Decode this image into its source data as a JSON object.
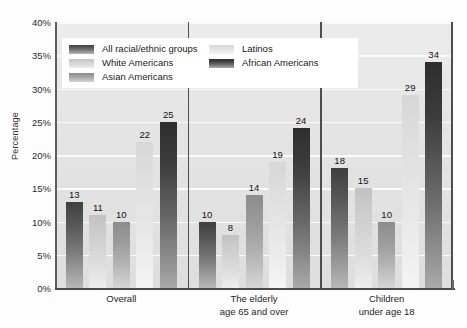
{
  "chart_data": {
    "type": "bar",
    "title": "",
    "xlabel": "",
    "ylabel": "Percentage",
    "ylim": [
      0,
      40
    ],
    "ytick_values": [
      0,
      5,
      10,
      15,
      20,
      25,
      30,
      35,
      40
    ],
    "ytick_labels": [
      "0%",
      "5%",
      "10%",
      "15%",
      "20%",
      "25%",
      "30%",
      "35%",
      "40%"
    ],
    "grid": true,
    "grid_orientation": "horizontal",
    "legend_position": "upper-left-inside",
    "categories": [
      "Overall",
      "The elderly age 65 and over",
      "Children under age 18"
    ],
    "category_lines": [
      [
        "Overall",
        ""
      ],
      [
        "The elderly",
        "age 65 and over"
      ],
      [
        "Children",
        "under age 18"
      ]
    ],
    "series": [
      {
        "name": "All racial/ethnic groups",
        "color": "#3f3f3f",
        "values": [
          13,
          10,
          18
        ]
      },
      {
        "name": "White Americans",
        "color": "#c9c9c9",
        "values": [
          11,
          8,
          15
        ]
      },
      {
        "name": "Asian Americans",
        "color": "#949494",
        "values": [
          10,
          14,
          10
        ]
      },
      {
        "name": "Latinos",
        "color": "#dedede",
        "values": [
          22,
          19,
          29
        ]
      },
      {
        "name": "African Americans",
        "color": "#2e2e2e",
        "values": [
          25,
          24,
          34
        ]
      }
    ],
    "value_labels": [
      [
        13,
        11,
        10,
        22,
        25
      ],
      [
        10,
        8,
        14,
        19,
        24
      ],
      [
        18,
        15,
        10,
        29,
        34
      ]
    ],
    "plot_background": "#e6e6e6",
    "gridline_color": "#fafafa",
    "axis_color": "#4d4d4d"
  }
}
